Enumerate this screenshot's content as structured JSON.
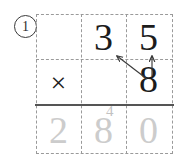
{
  "worksheet": {
    "problem_number": "1",
    "problem_number_style": "circled",
    "grid": {
      "columns": 3,
      "rows": 3,
      "border_style": "dashed",
      "border_color": "#9a9a9a"
    },
    "answer_rule_color": "#555555",
    "rows": [
      {
        "name": "multiplicand-row",
        "cells": [
          {
            "name": "cell-r1c1",
            "value": "",
            "tone": "dark"
          },
          {
            "name": "cell-r1c2",
            "value": "3",
            "tone": "dark"
          },
          {
            "name": "cell-r1c3",
            "value": "5",
            "tone": "dark"
          }
        ]
      },
      {
        "name": "multiplier-row",
        "cells": [
          {
            "name": "cell-r2c1",
            "value": "×",
            "tone": "dark"
          },
          {
            "name": "cell-r2c2",
            "value": "",
            "tone": "dark"
          },
          {
            "name": "cell-r2c3",
            "value": "8",
            "tone": "dark"
          }
        ]
      },
      {
        "name": "answer-row",
        "cells": [
          {
            "name": "cell-r3c1",
            "value": "2",
            "tone": "faint"
          },
          {
            "name": "cell-r3c2",
            "value": "8",
            "tone": "faint"
          },
          {
            "name": "cell-r3c3",
            "value": "0",
            "tone": "faint"
          }
        ]
      }
    ],
    "carry": {
      "value": "4",
      "tone": "faint",
      "position": "superscript-above-answer-tens"
    },
    "arrows": [
      {
        "name": "arrow-eight-to-three",
        "from": "cell-r2c3",
        "to": "cell-r1c2",
        "direction": "up-left",
        "color": "#3a3a3a"
      },
      {
        "name": "arrow-eight-to-five",
        "from": "cell-r2c3",
        "to": "cell-r1c3",
        "direction": "up",
        "color": "#3a3a3a"
      }
    ],
    "colors": {
      "ink": "#1c1c1c",
      "faint_ink": "#cccccc",
      "grid_line": "#9a9a9a",
      "rule": "#555555",
      "background": "#ffffff"
    }
  }
}
